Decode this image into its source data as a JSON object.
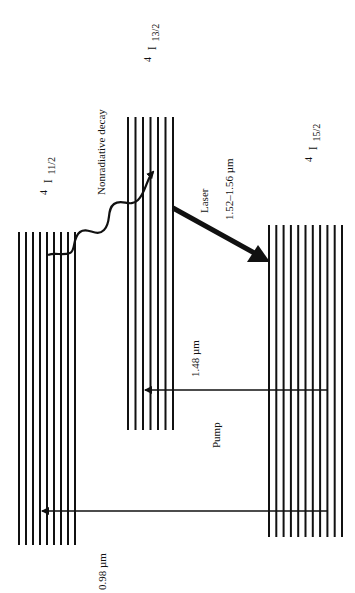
{
  "diagram": {
    "type": "energy-level diagram (Er3+ amplifier), rotated 90 degrees",
    "levels": [
      {
        "id": "4I11/2",
        "sup": "4",
        "sym": "I",
        "sub": "11/2",
        "line_count": 9
      },
      {
        "id": "4I13/2",
        "sup": "4",
        "sym": "I",
        "sub": "13/2",
        "line_count": 7
      },
      {
        "id": "4I15/2",
        "sup": "4",
        "sym": "I",
        "sub": "15/2",
        "line_count": 11
      }
    ],
    "transitions": [
      {
        "label": "0.98 µm",
        "from": "4I15/2",
        "to": "4I11/2",
        "kind": "pump"
      },
      {
        "label": "1.48 µm",
        "from": "4I15/2",
        "to": "4I13/2",
        "kind": "pump"
      },
      {
        "label": "Nonradiative decay",
        "from": "4I11/2",
        "to": "4I13/2",
        "kind": "wavy"
      },
      {
        "label_top": "Laser",
        "label_bottom": "1.52–1.56 µm",
        "from": "4I13/2",
        "to": "4I15/2",
        "kind": "laser"
      }
    ],
    "labels": {
      "pump": "Pump",
      "pump_098": "0.98 µm",
      "pump_148": "1.48 µm",
      "nonrad": "Nonradiative decay",
      "laser": "Laser",
      "laser_wl": "1.52–1.56 µm",
      "l11_sup": "4",
      "l11_sym": "I",
      "l11_sub": "11/2",
      "l13_sup": "4",
      "l13_sym": "I",
      "l13_sub": "13/2",
      "l15_sup": "4",
      "l15_sym": "I",
      "l15_sub": "15/2"
    }
  }
}
